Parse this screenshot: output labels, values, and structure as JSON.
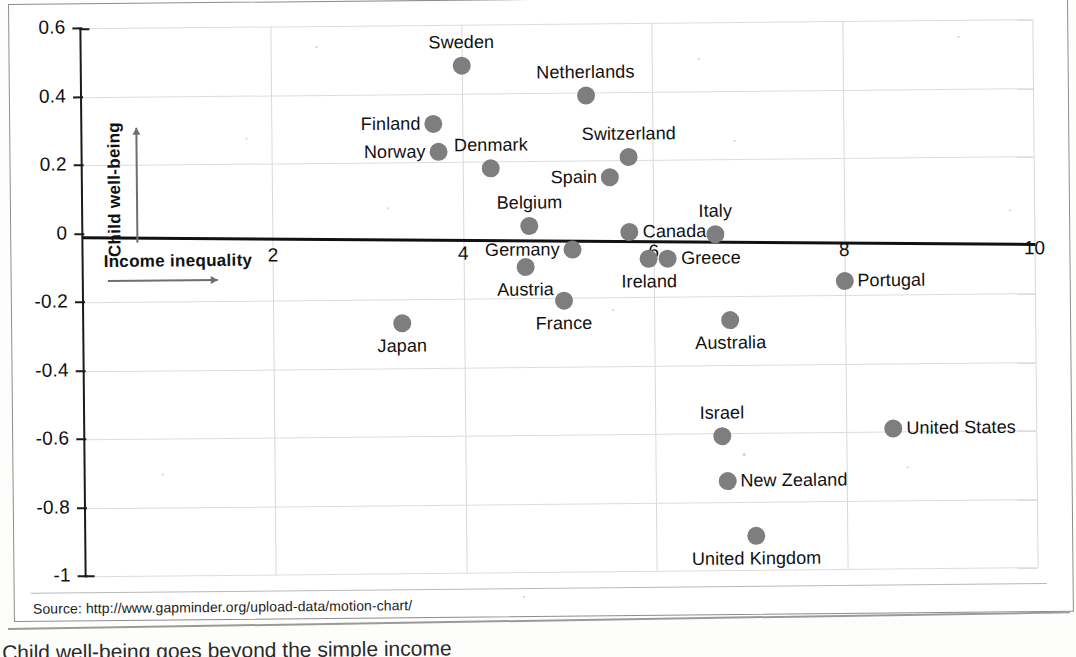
{
  "source": {
    "label": "Source: http://www.gapminder.org/upload-data/motion-chart/"
  },
  "caption": {
    "text": "Child well-being goes beyond the simple income"
  },
  "axes": {
    "y_description": "Child well-being",
    "x_description": "Income inequality",
    "y_ticks": [
      "0.6",
      "0.4",
      "0.2",
      "0",
      "-0.2",
      "-0.4",
      "-0.6",
      "-0.8",
      "-1"
    ],
    "x_ticks": [
      "2",
      "4",
      "6",
      "8",
      "10"
    ]
  },
  "colors": {
    "dot": "#7e7e7e",
    "axis": "#111111",
    "grid": "#d9d9d9",
    "page_border": "#8d8d8d"
  },
  "chart_data": {
    "type": "scatter",
    "title": "",
    "xlabel": "Income inequality",
    "ylabel": "Child well-being",
    "xlim": [
      0,
      10
    ],
    "ylim": [
      -1,
      0.6
    ],
    "xticks": [
      2,
      4,
      6,
      8,
      10
    ],
    "yticks": [
      0.6,
      0.4,
      0.2,
      0,
      -0.2,
      -0.4,
      -0.6,
      -0.8,
      -1
    ],
    "grid": true,
    "legend": "none",
    "annotations": [
      "trend line through approximately y = 0"
    ],
    "points": [
      {
        "name": "Sweden",
        "x": 4.0,
        "y": 0.48,
        "label_pos": "top"
      },
      {
        "name": "Netherlands",
        "x": 5.3,
        "y": 0.39,
        "label_pos": "top"
      },
      {
        "name": "Finland",
        "x": 3.7,
        "y": 0.31,
        "label_pos": "left"
      },
      {
        "name": "Norway",
        "x": 3.75,
        "y": 0.23,
        "label_pos": "left"
      },
      {
        "name": "Denmark",
        "x": 4.3,
        "y": 0.18,
        "label_pos": "top"
      },
      {
        "name": "Switzerland",
        "x": 5.75,
        "y": 0.21,
        "label_pos": "top"
      },
      {
        "name": "Spain",
        "x": 5.55,
        "y": 0.15,
        "label_pos": "left"
      },
      {
        "name": "Belgium",
        "x": 4.7,
        "y": 0.01,
        "label_pos": "top"
      },
      {
        "name": "Germany",
        "x": 5.15,
        "y": -0.06,
        "label_pos": "left"
      },
      {
        "name": "Canada",
        "x": 5.75,
        "y": -0.01,
        "label_pos": "right"
      },
      {
        "name": "Italy",
        "x": 6.65,
        "y": -0.02,
        "label_pos": "top"
      },
      {
        "name": "Ireland",
        "x": 5.95,
        "y": -0.09,
        "label_pos": "bottom"
      },
      {
        "name": "Greece",
        "x": 6.15,
        "y": -0.09,
        "label_pos": "right"
      },
      {
        "name": "Austria",
        "x": 4.65,
        "y": -0.11,
        "label_pos": "bottom"
      },
      {
        "name": "Portugal",
        "x": 8.0,
        "y": -0.16,
        "label_pos": "right"
      },
      {
        "name": "France",
        "x": 5.05,
        "y": -0.21,
        "label_pos": "bottom"
      },
      {
        "name": "Australia",
        "x": 6.8,
        "y": -0.27,
        "label_pos": "bottom"
      },
      {
        "name": "Japan",
        "x": 3.35,
        "y": -0.27,
        "label_pos": "bottom"
      },
      {
        "name": "Israel",
        "x": 6.7,
        "y": -0.61,
        "label_pos": "top"
      },
      {
        "name": "United States",
        "x": 8.5,
        "y": -0.59,
        "label_pos": "right"
      },
      {
        "name": "New Zealand",
        "x": 6.75,
        "y": -0.74,
        "label_pos": "right"
      },
      {
        "name": "United Kingdom",
        "x": 7.05,
        "y": -0.9,
        "label_pos": "bottom"
      }
    ]
  }
}
